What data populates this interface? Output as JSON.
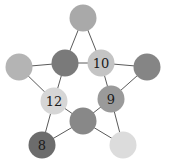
{
  "diagram": {
    "type": "pentagram-graph",
    "nodes": [
      {
        "id": "top",
        "label": "",
        "color": "#a9a9a9"
      },
      {
        "id": "inner-top-left",
        "label": "",
        "color": "#7a7a7a"
      },
      {
        "id": "inner-top-right",
        "label": "10",
        "color": "#c4c4c4"
      },
      {
        "id": "outer-left",
        "label": "",
        "color": "#b4b4b4"
      },
      {
        "id": "outer-right",
        "label": "",
        "color": "#858585"
      },
      {
        "id": "inner-left",
        "label": "12",
        "color": "#d6d6d6"
      },
      {
        "id": "inner-right",
        "label": "9",
        "color": "#9a9a9a"
      },
      {
        "id": "inner-bottom",
        "label": "",
        "color": "#888888"
      },
      {
        "id": "outer-bottom-left",
        "label": "8",
        "color": "#6c6c6c"
      },
      {
        "id": "outer-bottom-right",
        "label": "",
        "color": "#dcdcdc"
      }
    ],
    "edges": [
      [
        "top",
        "inner-top-left"
      ],
      [
        "top",
        "inner-top-right"
      ],
      [
        "inner-top-left",
        "inner-top-right"
      ],
      [
        "inner-top-right",
        "outer-right"
      ],
      [
        "outer-right",
        "inner-right"
      ],
      [
        "inner-top-right",
        "inner-right"
      ],
      [
        "inner-right",
        "inner-bottom"
      ],
      [
        "inner-right",
        "outer-bottom-right"
      ],
      [
        "outer-bottom-right",
        "inner-bottom"
      ],
      [
        "inner-bottom",
        "inner-left"
      ],
      [
        "inner-bottom",
        "outer-bottom-left"
      ],
      [
        "outer-bottom-left",
        "inner-left"
      ],
      [
        "inner-left",
        "outer-left"
      ],
      [
        "outer-left",
        "inner-top-left"
      ],
      [
        "inner-top-left",
        "inner-left"
      ]
    ]
  }
}
